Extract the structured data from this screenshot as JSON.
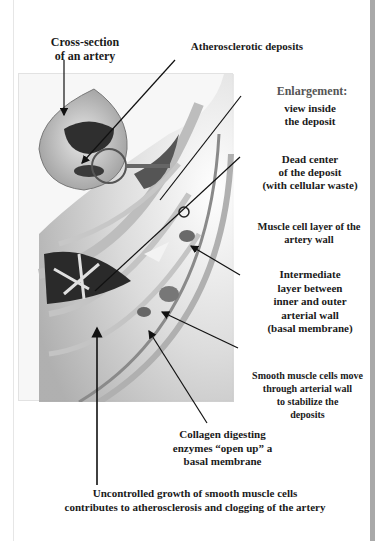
{
  "labels": {
    "cross_section": "Cross-section\nof an artery",
    "deposits": "Atherosclerotic deposits",
    "enlargement_heading": "Enlargement:",
    "enlargement_sub": "view inside\nthe deposit",
    "dead_center": "Dead center\nof the deposit\n(with  cellular waste)",
    "muscle_layer": "Muscle cell layer of the\nartery wall",
    "intermediate": "Intermediate\nlayer between\ninner and outer\narterial wall\n(basal membrane)",
    "smooth_muscle": "Smooth muscle cells move\nthrough arterial wall\nto stabilize the\ndeposits",
    "collagen": "Collagen digesting\nenzymes “open up” a\nbasal membrane",
    "caption": "Uncontrolled growth of smooth muscle cells\ncontributes to atherosclerosis and clogging of the artery"
  },
  "colors": {
    "text": "#1a1a1a",
    "arrow": "#111111",
    "illustration_bg": "#f7f7f7",
    "right_bar": "#a9a9a9"
  }
}
